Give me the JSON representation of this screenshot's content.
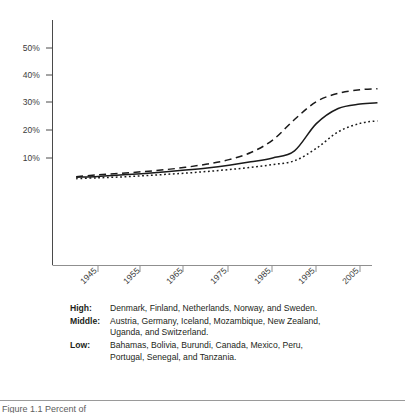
{
  "chart_data": {
    "type": "line",
    "title": "",
    "subtitle": "",
    "xlabel": "",
    "ylabel": "",
    "xlim": [
      1940,
      2010
    ],
    "ylim": [
      0,
      57
    ],
    "grid": false,
    "legend_position": "below-plot",
    "x_ticks": [
      1945,
      1955,
      1965,
      1975,
      1985,
      1995,
      2005
    ],
    "x_tick_labels": [
      "1945",
      "1955",
      "1965",
      "1975",
      "1985",
      "1995",
      "2005"
    ],
    "y_ticks": [
      10,
      20,
      30,
      40,
      50
    ],
    "y_tick_labels": [
      "10%",
      "20%",
      "30%",
      "40%",
      "50%"
    ],
    "x": [
      1940,
      1945,
      1950,
      1955,
      1960,
      1965,
      1970,
      1975,
      1980,
      1985,
      1990,
      1995,
      2000,
      2005,
      2009
    ],
    "series": [
      {
        "name": "High",
        "style": "dashed",
        "color": "#1a1a1a",
        "values": [
          3.2,
          3.9,
          4.4,
          5.0,
          5.7,
          6.6,
          7.8,
          9.4,
          12.0,
          16.5,
          24.0,
          30.5,
          33.5,
          34.8,
          35.2
        ]
      },
      {
        "name": "Middle",
        "style": "solid",
        "color": "#1a1a1a",
        "values": [
          3.0,
          3.3,
          3.8,
          4.3,
          4.9,
          5.6,
          6.4,
          7.4,
          8.6,
          10.0,
          12.6,
          22.5,
          28.0,
          29.6,
          30.1
        ]
      },
      {
        "name": "Low",
        "style": "dotted",
        "color": "#1a1a1a",
        "values": [
          2.5,
          2.8,
          3.1,
          3.5,
          4.0,
          4.5,
          5.1,
          5.8,
          6.6,
          7.6,
          9.0,
          13.5,
          19.5,
          22.6,
          23.5
        ]
      }
    ]
  },
  "legend": {
    "rows": [
      {
        "key": "High:",
        "lines": [
          "Denmark, Finland, Netherlands, Norway, and Sweden."
        ]
      },
      {
        "key": "Middle:",
        "lines": [
          "Austria, Germany, Iceland, Mozambique, New Zealand,",
          "Uganda, and Switzerland."
        ]
      },
      {
        "key": "Low:",
        "lines": [
          "Bahamas, Bolivia, Burundi, Canada, Mexico, Peru,",
          "Portugal, Senegal, and Tanzania."
        ]
      }
    ]
  },
  "footer": {
    "caption": "Figure 1.1    Percent of"
  }
}
